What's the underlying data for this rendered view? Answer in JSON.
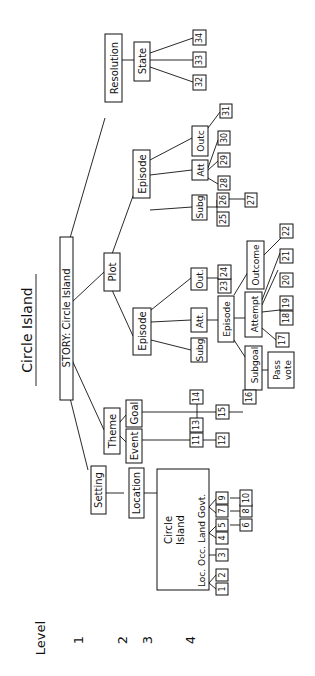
{
  "title": "Circle  Island",
  "level_legend": {
    "label": "Level",
    "levels": [
      "1",
      "2",
      "3",
      "4"
    ]
  },
  "nodes": {
    "root": "STORY: Circle Island",
    "setting": "Setting",
    "location": "Location",
    "circle_island_line1": "Circle",
    "circle_island_line2": "Island",
    "loc_labels": [
      "Loc.",
      "Occ.",
      "Land",
      "Govt."
    ],
    "theme": "Theme",
    "event": "Event",
    "goal": "Goal",
    "plot": "Plot",
    "episode_a": "Episode",
    "subg_a": "Subg",
    "att_a": "Att.",
    "out_a": "Out.",
    "episode_a_inner": "Episode",
    "subgoal": "Subgoal",
    "attempt": "Attempt",
    "outcome": "Outcome",
    "pass_vote_line1": "Pass",
    "pass_vote_line2": "vote",
    "episode_b": "Episode",
    "subg_b": "Subg",
    "att_b": "Att",
    "outc_b": "Outc",
    "resolution": "Resolution",
    "state": "State"
  },
  "numbered_leaves": [
    "1",
    "2",
    "3",
    "4",
    "5",
    "6",
    "7",
    "8",
    "9",
    "10",
    "11",
    "12",
    "13",
    "14",
    "15",
    "16",
    "17",
    "18",
    "19",
    "20",
    "21",
    "22",
    "23",
    "24",
    "25",
    "26",
    "27",
    "28",
    "29",
    "30",
    "31",
    "32",
    "33",
    "34"
  ]
}
